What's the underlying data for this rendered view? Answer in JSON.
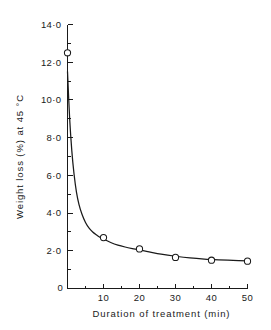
{
  "chart_data": {
    "type": "line",
    "title": "",
    "xlabel": "Duration of treatment (min)",
    "ylabel": "Weight loss (%) at 45 °C",
    "xlim": [
      0,
      50
    ],
    "ylim": [
      0,
      14
    ],
    "grid": false,
    "legend": null,
    "marker_style": "open-circle",
    "x": [
      0,
      10,
      20,
      30,
      40,
      50
    ],
    "values": [
      12.5,
      2.7,
      2.1,
      1.65,
      1.5,
      1.45
    ],
    "series": [
      {
        "name": "Weight loss at 45 °C",
        "x": [
          0,
          10,
          20,
          30,
          40,
          50
        ],
        "values": [
          12.5,
          2.7,
          2.1,
          1.65,
          1.5,
          1.45
        ]
      }
    ],
    "fitted_curve": {
      "description": "smooth exponential decay through data",
      "x": [
        0,
        0.6,
        1.2,
        1.8,
        2.5,
        3.2,
        4,
        5,
        6,
        7,
        8,
        9,
        10,
        12,
        14,
        16,
        18,
        20,
        23,
        26,
        30,
        34,
        38,
        42,
        46,
        50
      ],
      "y": [
        11.5,
        9.0,
        7.3,
        6.1,
        5.1,
        4.45,
        3.95,
        3.5,
        3.2,
        3.0,
        2.85,
        2.72,
        2.62,
        2.44,
        2.3,
        2.2,
        2.12,
        2.05,
        1.93,
        1.82,
        1.71,
        1.62,
        1.56,
        1.52,
        1.49,
        1.46
      ]
    },
    "x_ticks": [
      {
        "value": 0,
        "label": "0"
      },
      {
        "value": 10,
        "label": "10"
      },
      {
        "value": 20,
        "label": "20"
      },
      {
        "value": 30,
        "label": "30"
      },
      {
        "value": 40,
        "label": "40"
      },
      {
        "value": 50,
        "label": "50"
      }
    ],
    "x_minor_ticks": [
      5,
      15,
      25,
      35,
      45
    ],
    "y_ticks": [
      {
        "value": 0,
        "label": "0"
      },
      {
        "value": 2,
        "label": "2·0"
      },
      {
        "value": 4,
        "label": "4·0"
      },
      {
        "value": 6,
        "label": "6·0"
      },
      {
        "value": 8,
        "label": "8·0"
      },
      {
        "value": 10,
        "label": "10·0"
      },
      {
        "value": 12,
        "label": "12·0"
      },
      {
        "value": 14,
        "label": "14·0"
      }
    ],
    "y_minor_ticks": [
      1,
      3,
      5,
      7,
      9,
      11,
      13
    ],
    "origin_label": "0",
    "colors": {
      "line": "#1a1a1a",
      "marker_fill": "#ffffff",
      "marker_edge": "#1a1a1a",
      "axis": "#1a1a1a",
      "background": "#ffffff"
    }
  }
}
